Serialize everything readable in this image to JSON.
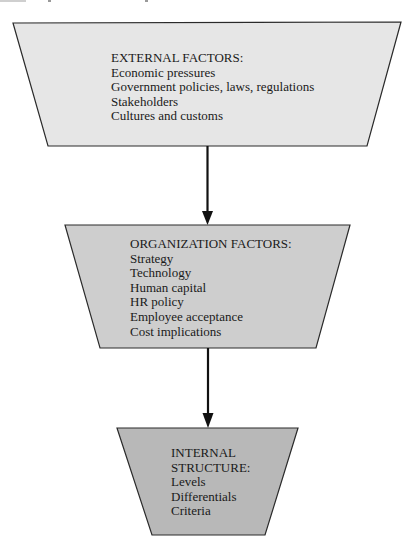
{
  "diagram": {
    "type": "flow",
    "direction": "top-to-bottom",
    "nodes": [
      {
        "id": "external",
        "shape": "inverted-trapezoid",
        "fill": "#e6e6e6",
        "heading": "EXTERNAL FACTORS:",
        "items": [
          "Economic pressures",
          "Government policies, laws, regulations",
          "Stakeholders",
          "Cultures and customs"
        ]
      },
      {
        "id": "organization",
        "shape": "inverted-trapezoid",
        "fill": "#cecece",
        "heading": "ORGANIZATION FACTORS:",
        "items": [
          "Strategy",
          "Technology",
          "Human capital",
          "HR policy",
          "Employee acceptance",
          "Cost implications"
        ]
      },
      {
        "id": "internal",
        "shape": "inverted-trapezoid",
        "fill": "#b8b8b8",
        "heading_lines": [
          "INTERNAL",
          "STRUCTURE:"
        ],
        "items": [
          "Levels",
          "Differentials",
          "Criteria"
        ]
      }
    ],
    "edges": [
      {
        "from": "external",
        "to": "organization"
      },
      {
        "from": "organization",
        "to": "internal"
      }
    ],
    "colors": {
      "stroke": "#2a2a2a",
      "arrow": "#111111",
      "text": "#1a1a1a"
    }
  }
}
